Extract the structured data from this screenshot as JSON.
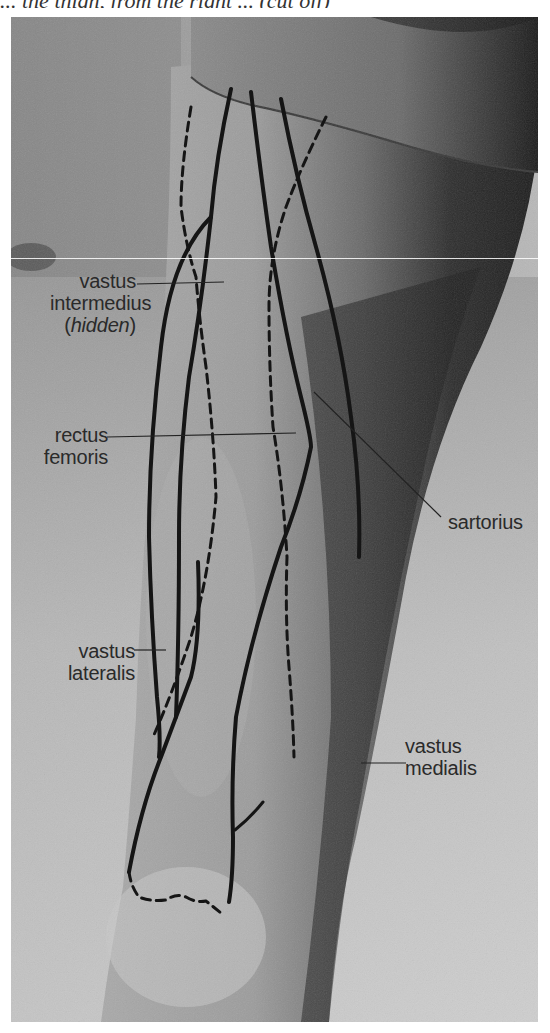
{
  "caption_fragment": "... the thigh, from the right ... (cut off)",
  "figure": {
    "colors": {
      "background_page": "#ffffff",
      "photo_light": "#c8c8c8",
      "photo_mid": "#8e8e8e",
      "photo_dark": "#2b2b2b",
      "outline": "#1a1a1a",
      "label_text": "#2a2a2a"
    }
  },
  "labels": [
    {
      "id": "vastus-intermedius",
      "lines": [
        "vastus",
        "intermedius"
      ],
      "note": "hidden"
    },
    {
      "id": "rectus-femoris",
      "lines": [
        "rectus",
        "femoris"
      ]
    },
    {
      "id": "sartorius",
      "lines": [
        "sartorius"
      ]
    },
    {
      "id": "vastus-lateralis",
      "lines": [
        "vastus",
        "lateralis"
      ]
    },
    {
      "id": "vastus-medialis",
      "lines": [
        "vastus",
        "medialis"
      ]
    }
  ]
}
